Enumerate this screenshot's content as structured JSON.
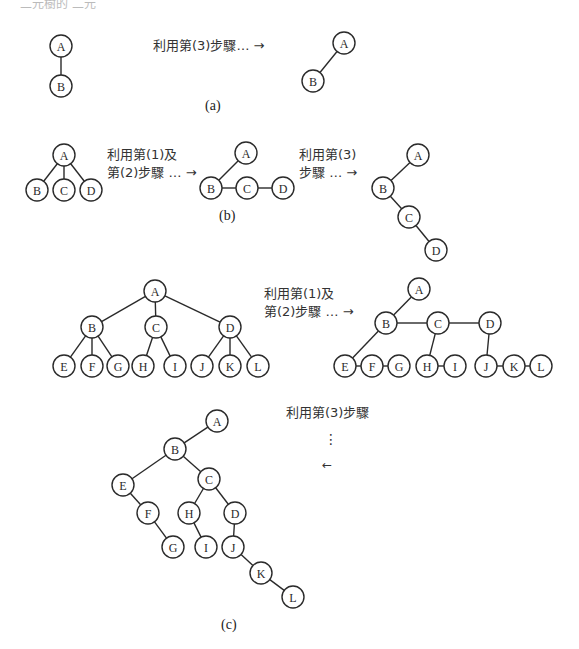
{
  "header": {
    "cropped_text": "二元樹的 二元"
  },
  "sections": {
    "a": {
      "caption": "(a)",
      "step_label": "利用第(3)步驟… →"
    },
    "b": {
      "caption": "(b)",
      "step1_label_line1": "利用第(1)及",
      "step1_label_line2": "第(2)步驟 … →",
      "step2_label_line1": "利用第(3)",
      "step2_label_line2": "步驟 … →"
    },
    "c": {
      "caption": "(c)",
      "step1_label_line1": "利用第(1)及",
      "step1_label_line2": "第(2)步驟 … →",
      "step2_label": "利用第(3)步驟",
      "step2_dots": "⋮",
      "step2_arrow": "←"
    }
  },
  "trees": [
    {
      "id": "a-tree",
      "nodes": {
        "A": [
          61,
          46
        ],
        "B": [
          61,
          86
        ]
      },
      "edges": [
        [
          "A",
          "B"
        ]
      ]
    },
    {
      "id": "a-binary",
      "nodes": {
        "A": [
          344,
          43
        ],
        "B": [
          313,
          81
        ]
      },
      "edges": [
        [
          "A",
          "B"
        ]
      ]
    },
    {
      "id": "b-tree",
      "nodes": {
        "A": [
          64,
          155
        ],
        "B": [
          37,
          190
        ],
        "C": [
          64,
          190
        ],
        "D": [
          91,
          190
        ]
      },
      "edges": [
        [
          "A",
          "B"
        ],
        [
          "A",
          "C"
        ],
        [
          "A",
          "D"
        ]
      ]
    },
    {
      "id": "b-linked",
      "nodes": {
        "A": [
          246,
          153
        ],
        "B": [
          211,
          188
        ],
        "C": [
          247,
          188
        ],
        "D": [
          283,
          188
        ]
      },
      "edges": [
        [
          "A",
          "B"
        ],
        [
          "B",
          "C"
        ],
        [
          "C",
          "D"
        ]
      ]
    },
    {
      "id": "b-binary",
      "nodes": {
        "A": [
          418,
          155
        ],
        "B": [
          383,
          188
        ],
        "C": [
          409,
          217
        ],
        "D": [
          436,
          250
        ]
      },
      "edges": [
        [
          "A",
          "B"
        ],
        [
          "B",
          "C"
        ],
        [
          "C",
          "D"
        ]
      ]
    },
    {
      "id": "c-tree",
      "nodes": {
        "A": [
          155,
          291
        ],
        "B": [
          92,
          327
        ],
        "C": [
          156,
          327
        ],
        "D": [
          230,
          327
        ],
        "E": [
          64,
          366
        ],
        "F": [
          92,
          366
        ],
        "G": [
          118,
          366
        ],
        "H": [
          143,
          366
        ],
        "I": [
          175,
          366
        ],
        "J": [
          202,
          366
        ],
        "K": [
          230,
          366
        ],
        "L": [
          258,
          366
        ]
      },
      "edges": [
        [
          "A",
          "B"
        ],
        [
          "A",
          "C"
        ],
        [
          "A",
          "D"
        ],
        [
          "B",
          "E"
        ],
        [
          "B",
          "F"
        ],
        [
          "B",
          "G"
        ],
        [
          "C",
          "H"
        ],
        [
          "C",
          "I"
        ],
        [
          "D",
          "J"
        ],
        [
          "D",
          "K"
        ],
        [
          "D",
          "L"
        ]
      ]
    },
    {
      "id": "c-linked",
      "nodes": {
        "A": [
          419,
          289
        ],
        "B": [
          386,
          323
        ],
        "C": [
          438,
          323
        ],
        "D": [
          490,
          323
        ],
        "E": [
          345,
          366
        ],
        "F": [
          372,
          366
        ],
        "G": [
          399,
          366
        ],
        "H": [
          427,
          366
        ],
        "I": [
          455,
          366
        ],
        "J": [
          486,
          366
        ],
        "K": [
          514,
          366
        ],
        "L": [
          541,
          366
        ]
      },
      "edges": [
        [
          "A",
          "B"
        ],
        [
          "B",
          "C"
        ],
        [
          "C",
          "D"
        ],
        [
          "B",
          "E"
        ],
        [
          "E",
          "F"
        ],
        [
          "F",
          "G"
        ],
        [
          "C",
          "H"
        ],
        [
          "H",
          "I"
        ],
        [
          "D",
          "J"
        ],
        [
          "J",
          "K"
        ],
        [
          "K",
          "L"
        ]
      ]
    },
    {
      "id": "c-binary",
      "nodes": {
        "A": [
          217,
          421
        ],
        "B": [
          175,
          449
        ],
        "C": [
          209,
          479
        ],
        "E": [
          123,
          485
        ],
        "F": [
          148,
          513
        ],
        "H": [
          189,
          513
        ],
        "D": [
          235,
          513
        ],
        "G": [
          173,
          547
        ],
        "I": [
          206,
          547
        ],
        "J": [
          233,
          547
        ],
        "K": [
          261,
          573
        ],
        "L": [
          293,
          597
        ]
      },
      "edges": [
        [
          "A",
          "B"
        ],
        [
          "B",
          "E"
        ],
        [
          "B",
          "C"
        ],
        [
          "E",
          "F"
        ],
        [
          "F",
          "G"
        ],
        [
          "C",
          "H"
        ],
        [
          "C",
          "D"
        ],
        [
          "H",
          "I"
        ],
        [
          "D",
          "J"
        ],
        [
          "J",
          "K"
        ],
        [
          "K",
          "L"
        ]
      ]
    }
  ],
  "style": {
    "node_radius": 11,
    "stroke": "#2a2a2a"
  }
}
